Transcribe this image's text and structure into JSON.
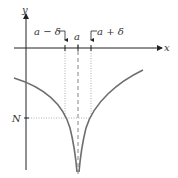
{
  "diagram": {
    "type": "function-graph",
    "axes": {
      "x_label": "x",
      "y_label": "y"
    },
    "markers": {
      "a_minus_delta": "a − δ",
      "a": "a",
      "a_plus_delta": "a + δ",
      "N": "N"
    },
    "colors": {
      "axis": "#222222",
      "curve": "#6e6e6e",
      "guide": "#9a9a9a"
    }
  }
}
